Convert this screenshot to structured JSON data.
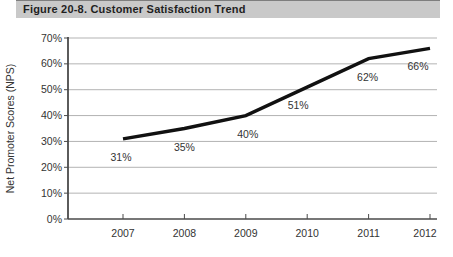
{
  "figure": {
    "title_bar": {
      "label": "Figure 20-8. Customer Satisfaction Trend",
      "bg_color": "#c9c9c9",
      "text_color": "#1f1f1f"
    }
  },
  "chart_data": {
    "type": "line",
    "title": "Figure 20-8. Customer Satisfaction Trend",
    "categories": [
      "2007",
      "2008",
      "2009",
      "2010",
      "2011",
      "2012"
    ],
    "values": [
      31,
      35,
      40,
      51,
      62,
      66
    ],
    "point_labels": [
      "31%",
      "35%",
      "40%",
      "51%",
      "62%",
      "66%"
    ],
    "xlabel": "",
    "ylabel": "Net Promoter Scores (NPS)",
    "ylim": [
      0,
      70
    ],
    "ytick_step": 10,
    "ytick_labels": [
      "0%",
      "10%",
      "20%",
      "30%",
      "40%",
      "50%",
      "60%",
      "70%"
    ],
    "grid": "horizontal",
    "legend": "none",
    "colors": {
      "line": "#111111",
      "gridline": "#b3b3b3",
      "axis": "#4a4a4a",
      "text": "#333333"
    }
  }
}
